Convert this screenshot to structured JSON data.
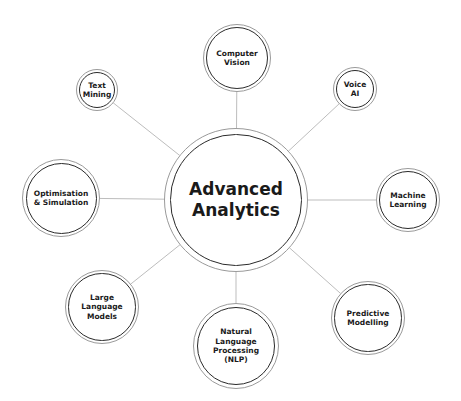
{
  "center": {
    "label": "Advanced\nAnalytics",
    "x": 236,
    "y": 200,
    "r": 72,
    "font": 17
  },
  "nodes": [
    {
      "id": "computer-vision",
      "label": "Computer\nVision",
      "x": 237,
      "y": 58,
      "r": 34,
      "font": 7.5
    },
    {
      "id": "voice-ai",
      "label": "Voice\nAI",
      "x": 355,
      "y": 89,
      "r": 22,
      "font": 7.5
    },
    {
      "id": "machine-learning",
      "label": "Machine\nLearning",
      "x": 408,
      "y": 200,
      "r": 32,
      "font": 7.5
    },
    {
      "id": "predictive-modelling",
      "label": "Predictive\nModelling",
      "x": 368,
      "y": 318,
      "r": 37,
      "font": 7.5
    },
    {
      "id": "nlp",
      "label": "Natural\nLanguage\nProcessing\n(NLP)",
      "x": 236,
      "y": 346,
      "r": 43,
      "font": 7.5
    },
    {
      "id": "large-language-models",
      "label": "Large\nLanguage\nModels",
      "x": 102,
      "y": 307,
      "r": 37,
      "font": 7.5
    },
    {
      "id": "optimisation-simulation",
      "label": "Optimisation\n& Simulation",
      "x": 61,
      "y": 198,
      "r": 39,
      "font": 7.5
    },
    {
      "id": "text-mining",
      "label": "Text\nMining",
      "x": 97,
      "y": 90,
      "r": 21,
      "font": 7.5
    }
  ],
  "colors": {
    "line": "#bdbdbd",
    "ring_outer": "#9a9a9a",
    "ring_inner": "#2a2a2a",
    "text": "#1a1a1a"
  }
}
